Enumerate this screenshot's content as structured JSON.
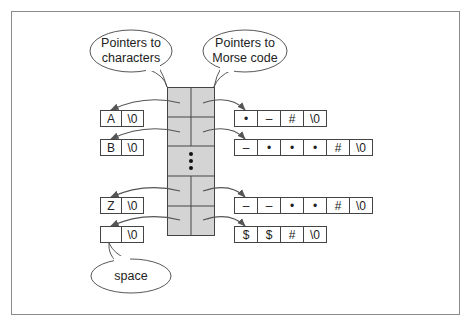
{
  "colors": {
    "frame": "#8a8a8a",
    "line": "#444444",
    "column_fill": "#d4d4d4",
    "arrow": "#555555",
    "text": "#222222",
    "background": "#ffffff"
  },
  "callouts": {
    "characters": {
      "line1": "Pointers to",
      "line2": "characters"
    },
    "morse": {
      "line1": "Pointers to",
      "line2": "Morse code"
    },
    "space": {
      "label": "space"
    }
  },
  "pointer_column": {
    "ellipsis": "⋮",
    "rows": [
      {
        "char": [
          "A",
          "\\0"
        ],
        "morse": [
          "•",
          "–",
          "#",
          "\\0"
        ]
      },
      {
        "char": [
          "B",
          "\\0"
        ],
        "morse": [
          "–",
          "•",
          "•",
          "•",
          "#",
          "\\0"
        ]
      },
      {
        "char": [
          "Z",
          "\\0"
        ],
        "morse": [
          "–",
          "–",
          "•",
          "•",
          "#",
          "\\0"
        ]
      },
      {
        "char": [
          "",
          "\\0"
        ],
        "morse": [
          "$",
          "$",
          "#",
          "\\0"
        ]
      }
    ]
  }
}
